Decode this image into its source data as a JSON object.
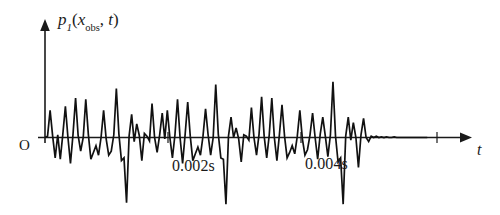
{
  "figure": {
    "name": "time-domain-pressure-signal",
    "background_color": "#ffffff",
    "line_color": "#111111",
    "axis_color": "#1a1a1a"
  },
  "axes": {
    "y_label": {
      "symbol": "p",
      "subscript": "1",
      "open_paren": "(",
      "arg1": "x",
      "arg1_subscript": "obs",
      "comma": ", ",
      "arg2": "t",
      "close_paren": ")",
      "full_text": "p_1(x_obs, t)"
    },
    "x_label": "t",
    "origin_label": "O"
  },
  "annotations": [
    {
      "label": "0.002s",
      "value": 0.002,
      "unit": "s"
    },
    {
      "label": "0.004s",
      "value": 0.004,
      "unit": "s"
    }
  ],
  "chart_data": {
    "type": "line",
    "title": "",
    "subtitle": "",
    "xlabel": "t",
    "ylabel": "p_1(x_obs, t)",
    "legend": [],
    "legend_position": "none",
    "grid": false,
    "axis_style": "arrowed-half-axes",
    "xlim": [
      0,
      0.0062
    ],
    "ylim": [
      -1.05,
      1.0
    ],
    "x_tick_labels": [
      "0.002s",
      "0.004s"
    ],
    "x_tick_values": [
      0.002,
      0.004
    ],
    "y_tick_labels": [],
    "series": [
      {
        "name": "p1",
        "x": [
          0.0,
          4e-05,
          8e-05,
          0.00012,
          0.00016,
          0.0002,
          0.00024,
          0.00028,
          0.00032,
          0.00036,
          0.0004,
          0.00044,
          0.00048,
          0.00052,
          0.00056,
          0.0006,
          0.00064,
          0.00068,
          0.00072,
          0.00076,
          0.0008,
          0.00084,
          0.00088,
          0.00092,
          0.00096,
          0.001,
          0.00104,
          0.00108,
          0.00112,
          0.00116,
          0.0012,
          0.00124,
          0.00128,
          0.00132,
          0.00136,
          0.0014,
          0.00144,
          0.00148,
          0.00152,
          0.00156,
          0.0016,
          0.00164,
          0.00168,
          0.00172,
          0.00176,
          0.0018,
          0.00184,
          0.00188,
          0.00192,
          0.00196,
          0.002,
          0.00204,
          0.00208,
          0.00212,
          0.00216,
          0.0022,
          0.00224,
          0.00228,
          0.00232,
          0.00236,
          0.0024,
          0.00244,
          0.00248,
          0.00252,
          0.00256,
          0.0026,
          0.00264,
          0.00268,
          0.00272,
          0.00276,
          0.0028,
          0.00284,
          0.00288,
          0.00292,
          0.00296,
          0.003,
          0.00304,
          0.00308,
          0.00312,
          0.00316,
          0.0032,
          0.00324,
          0.00328,
          0.00332,
          0.00336,
          0.0034,
          0.00344,
          0.00348,
          0.00352,
          0.00356,
          0.0036,
          0.00364,
          0.00368,
          0.00372,
          0.00376,
          0.0038,
          0.00384,
          0.00388,
          0.00392,
          0.00396,
          0.004,
          0.00404,
          0.00408,
          0.00412,
          0.00416,
          0.0042,
          0.00424,
          0.00428,
          0.00432,
          0.00436,
          0.0044,
          0.00444,
          0.00448,
          0.00452,
          0.00456,
          0.0046,
          0.00464,
          0.00468,
          0.00472,
          0.00476,
          0.0048,
          0.00484,
          0.00488,
          0.00492,
          0.00496,
          0.005,
          0.00504,
          0.00508,
          0.00512,
          0.00516,
          0.0052,
          0.00524,
          0.00528,
          0.00532,
          0.00536,
          0.0054,
          0.00544,
          0.00548,
          0.00552,
          0.00556,
          0.0056,
          0.00564,
          0.00568,
          0.00572,
          0.00576,
          0.0058,
          0.00584,
          0.00588,
          0.00592,
          0.00596,
          0.006
        ],
        "values": [
          0.0,
          0.02,
          0.4,
          0.02,
          -0.3,
          0.04,
          -0.32,
          0.05,
          0.46,
          0.0,
          -0.38,
          0.05,
          0.58,
          0.03,
          -0.2,
          0.0,
          0.56,
          0.05,
          -0.32,
          -0.22,
          -0.12,
          -0.26,
          0.0,
          0.4,
          -0.02,
          -0.26,
          -0.2,
          0.04,
          0.72,
          0.05,
          -0.34,
          -0.3,
          -0.96,
          0.02,
          0.34,
          -0.06,
          0.2,
          0.03,
          -0.34,
          0.06,
          0.02,
          -0.05,
          0.5,
          0.0,
          -0.22,
          0.04,
          0.36,
          -0.02,
          0.4,
          0.0,
          -0.3,
          0.04,
          0.56,
          0.0,
          -0.38,
          0.05,
          0.52,
          0.02,
          -0.34,
          -0.24,
          -0.14,
          -0.26,
          0.02,
          0.42,
          0.04,
          -0.26,
          0.0,
          0.78,
          0.05,
          -0.3,
          -0.32,
          -0.98,
          0.02,
          0.3,
          0.0,
          0.14,
          -0.02,
          -0.36,
          0.04,
          0.02,
          -0.04,
          0.44,
          0.0,
          -0.26,
          0.05,
          0.6,
          0.02,
          -0.3,
          0.04,
          0.58,
          0.0,
          -0.34,
          0.05,
          0.48,
          0.02,
          -0.3,
          -0.22,
          -0.12,
          -0.24,
          0.02,
          0.4,
          -0.02,
          -0.26,
          -0.18,
          0.04,
          0.36,
          0.0,
          -0.32,
          0.05,
          0.3,
          0.02,
          -0.28,
          0.04,
          0.82,
          0.02,
          -0.36,
          -0.3,
          -0.98,
          0.02,
          0.3,
          -0.04,
          0.22,
          0.0,
          -0.44,
          0.04,
          0.28,
          0.0,
          -0.06,
          0.02,
          0.0,
          0.02,
          0.0,
          0.01,
          0.0,
          0.01,
          0.0,
          0.0,
          0.01,
          0.0,
          0.0,
          0.0,
          0.0,
          0.0,
          0.0,
          0.0,
          0.0,
          0.0,
          0.0,
          0.0,
          0.0,
          0.0
        ]
      }
    ]
  }
}
